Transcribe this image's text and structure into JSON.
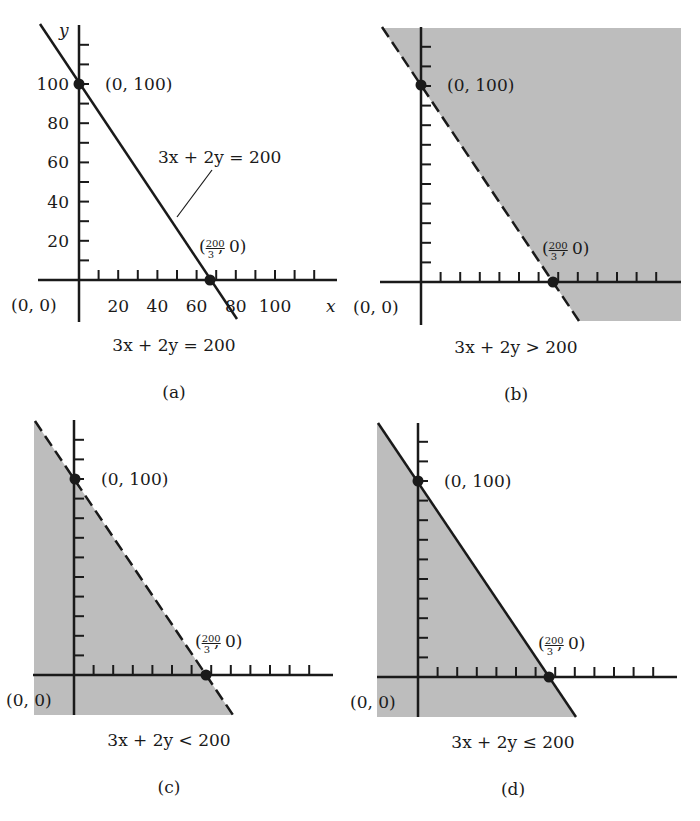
{
  "figure": {
    "colors": {
      "ink": "#1a1a1a",
      "shade": "#bdbdbd",
      "background": "#ffffff"
    },
    "common_labels": {
      "point_y_intercept": "(0, 100)",
      "point_x_intercept_open": "(",
      "point_x_intercept_num": "200",
      "point_x_intercept_den": "3",
      "point_x_intercept_close": ", 0)",
      "origin": "(0, 0)"
    }
  },
  "panels": [
    {
      "id": "a",
      "tag": "(a)",
      "caption": "3x + 2y = 200",
      "line_style": "solid",
      "shading": "none",
      "line_annotation": "3x + 2y = 200",
      "axis_labels": {
        "x": "x",
        "y": "y"
      },
      "y_tick_labels": [
        "100",
        "80",
        "60",
        "40",
        "20"
      ],
      "x_tick_labels": [
        "20",
        "40",
        "60",
        "80",
        "100"
      ],
      "geom": {
        "ox": 79,
        "oy": 280,
        "yTop": 25,
        "yBottom": 322,
        "xLeft": 38,
        "xRight": 337,
        "p100": [
          79,
          84
        ],
        "pX": [
          210,
          280
        ],
        "lineTop": [
          40,
          24
        ],
        "lineBottom": [
          237,
          319
        ],
        "tick": 19.6,
        "nY": 12,
        "nX": 12
      }
    },
    {
      "id": "b",
      "tag": "(b)",
      "caption": "3x + 2y > 200",
      "line_style": "dashed",
      "shading": "above",
      "geom": {
        "ox": 421,
        "oy": 282,
        "yTop": 27,
        "yBottom": 325,
        "xLeft": 380,
        "xRight": 681,
        "p100": [
          421,
          85
        ],
        "pX": [
          553,
          282
        ],
        "lineTop": [
          382,
          27
        ],
        "lineBottom": [
          579,
          321
        ],
        "shadeRight": 681,
        "shadeTop": 28,
        "shadeBottom": 321,
        "tick": 19.6,
        "nY": 12,
        "nX": 12
      }
    },
    {
      "id": "c",
      "tag": "(c)",
      "caption": "3x + 2y < 200",
      "line_style": "dashed",
      "shading": "below",
      "geom": {
        "ox": 74,
        "oy": 675,
        "yTop": 420,
        "yBottom": 715,
        "xLeft": 33,
        "xRight": 333,
        "p100": [
          75,
          479
        ],
        "pX": [
          206,
          675
        ],
        "lineTop": [
          35,
          421
        ],
        "lineBottom": [
          233,
          715
        ],
        "shadeLeft": 34,
        "shadeBottom": 715,
        "tick": 19.6,
        "nY": 12,
        "nX": 12
      }
    },
    {
      "id": "d",
      "tag": "(d)",
      "caption": "3x + 2y ≤ 200",
      "line_style": "solid",
      "shading": "below",
      "geom": {
        "ox": 418,
        "oy": 677,
        "yTop": 423,
        "yBottom": 717,
        "xLeft": 377,
        "xRight": 677,
        "p100": [
          418,
          481
        ],
        "pX": [
          549,
          677
        ],
        "lineTop": [
          378,
          423
        ],
        "lineBottom": [
          576,
          717
        ],
        "shadeLeft": 377,
        "shadeBottom": 717,
        "tick": 19.6,
        "nY": 12,
        "nX": 12
      }
    }
  ],
  "chart_data": [
    {
      "type": "line",
      "title": "(a) 3x + 2y = 200",
      "xlabel": "x",
      "ylabel": "y",
      "x_ticks": [
        20,
        40,
        60,
        80,
        100
      ],
      "y_ticks": [
        20,
        40,
        60,
        80,
        100
      ],
      "series": [
        {
          "name": "3x + 2y = 200",
          "x": [
            0,
            66.67
          ],
          "y": [
            100,
            0
          ],
          "style": "solid"
        }
      ],
      "points": [
        {
          "label": "(0, 100)",
          "x": 0,
          "y": 100
        },
        {
          "label": "(200/3, 0)",
          "x": 66.67,
          "y": 0
        }
      ],
      "annotations": [
        "(0, 0)",
        "3x + 2y = 200"
      ],
      "grid": false
    },
    {
      "type": "area",
      "title": "(b) 3x + 2y > 200",
      "series": [
        {
          "name": "3x + 2y = 200",
          "x": [
            0,
            66.67
          ],
          "y": [
            100,
            0
          ],
          "style": "dashed"
        }
      ],
      "shaded_region": "above line (excludes boundary)",
      "points": [
        {
          "label": "(0, 100)",
          "x": 0,
          "y": 100
        },
        {
          "label": "(200/3, 0)",
          "x": 66.67,
          "y": 0
        }
      ],
      "annotations": [
        "(0, 0)"
      ]
    },
    {
      "type": "area",
      "title": "(c) 3x + 2y < 200",
      "series": [
        {
          "name": "3x + 2y = 200",
          "x": [
            0,
            66.67
          ],
          "y": [
            100,
            0
          ],
          "style": "dashed"
        }
      ],
      "shaded_region": "below line (excludes boundary)",
      "points": [
        {
          "label": "(0, 100)",
          "x": 0,
          "y": 100
        },
        {
          "label": "(200/3, 0)",
          "x": 66.67,
          "y": 0
        }
      ],
      "annotations": [
        "(0, 0)"
      ]
    },
    {
      "type": "area",
      "title": "(d) 3x + 2y ≤ 200",
      "series": [
        {
          "name": "3x + 2y = 200",
          "x": [
            0,
            66.67
          ],
          "y": [
            100,
            0
          ],
          "style": "solid"
        }
      ],
      "shaded_region": "below line (includes boundary)",
      "points": [
        {
          "label": "(0, 100)",
          "x": 0,
          "y": 100
        },
        {
          "label": "(200/3, 0)",
          "x": 66.67,
          "y": 0
        }
      ],
      "annotations": [
        "(0, 0)"
      ]
    }
  ]
}
